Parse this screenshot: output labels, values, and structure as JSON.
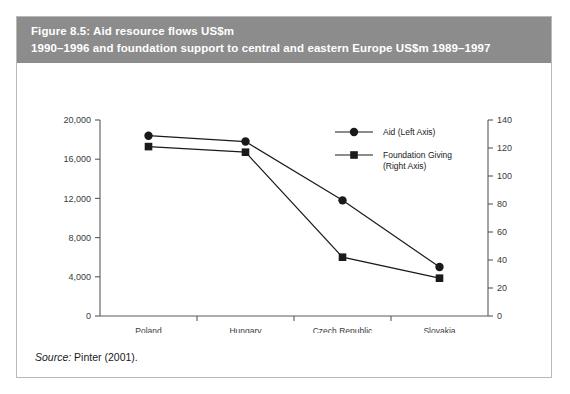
{
  "figure": {
    "title_line1": "Figure 8.5: Aid resource flows US$m",
    "title_line2": "1990–1996 and foundation support to central and eastern Europe US$m 1989–1997",
    "source_label": "Source:",
    "source_text": " Pinter (2001).",
    "header_color": "#8c8c8c",
    "border_color": "#b9b9b9",
    "series_color": "#1a1a1a"
  },
  "chart_data": {
    "type": "line",
    "title": "Figure 8.5: Aid resource flows US$m 1990–1996 and foundation support to central and eastern Europe US$m 1989–1997",
    "xlabel": "",
    "ylabel": "",
    "categories": [
      "Poland",
      "Hungary",
      "Czech Republic",
      "Slovakia"
    ],
    "series": [
      {
        "name": "Aid (Left Axis)",
        "axis": "left",
        "marker": "circle",
        "values": [
          18400,
          17800,
          11800,
          5000
        ]
      },
      {
        "name": "Foundation Giving (Right Axis)",
        "axis": "right",
        "marker": "square",
        "values": [
          121,
          117,
          42,
          27
        ]
      }
    ],
    "left_axis": {
      "ticks": [
        "0",
        "4,000",
        "8,000",
        "12,000",
        "16,000",
        "20,000"
      ],
      "tick_values": [
        0,
        4000,
        8000,
        12000,
        16000,
        20000
      ],
      "ylim": [
        0,
        20000
      ]
    },
    "right_axis": {
      "ticks": [
        "0",
        "20",
        "40",
        "60",
        "80",
        "100",
        "120",
        "140"
      ],
      "tick_values": [
        0,
        20,
        40,
        60,
        80,
        100,
        120,
        140
      ],
      "ylim": [
        0,
        140
      ]
    },
    "grid": false,
    "legend_position": "center-right-inside"
  },
  "legend": {
    "items": [
      {
        "label": "Aid (Left Axis)",
        "marker": "circle"
      },
      {
        "label_line1": "Foundation Giving",
        "label_line2": "(Right Axis)",
        "marker": "square"
      }
    ]
  }
}
